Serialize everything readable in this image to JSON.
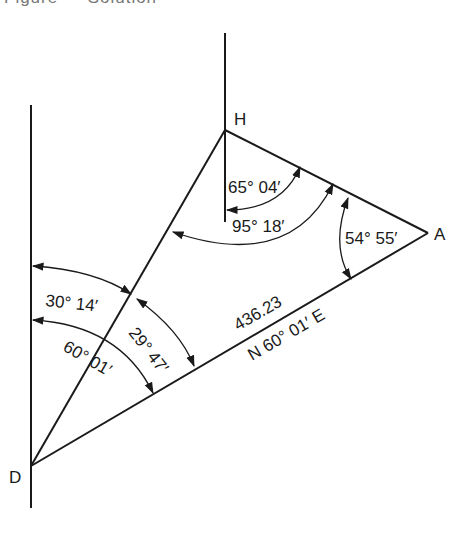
{
  "caption": "Figure — Solution",
  "diagram": {
    "points": [
      {
        "name": "H",
        "x": 225,
        "y": 130
      },
      {
        "name": "A",
        "x": 428,
        "y": 233
      },
      {
        "name": "D",
        "x": 31,
        "y": 466
      }
    ],
    "labels": {
      "H": "H",
      "A": "A",
      "D": "D",
      "angle_h_inner": "65° 04′",
      "angle_h_outer": "95° 18′",
      "angle_a": "54° 55′",
      "angle_d_north_to_dh": "30° 14′",
      "angle_d_dh_to_da": "29° 47′",
      "angle_d_north_to_da": "60° 01′",
      "line_da_length": "436.23",
      "line_da_bearing": "N 60° 01′ E"
    },
    "edges": [
      {
        "from": "D",
        "to": "H"
      },
      {
        "from": "H",
        "to": "A"
      },
      {
        "from": "D",
        "to": "A"
      }
    ],
    "meridians": [
      {
        "at": "D",
        "description": "north-south reference line through D"
      },
      {
        "at": "H",
        "description": "north-south reference line through H"
      }
    ]
  }
}
